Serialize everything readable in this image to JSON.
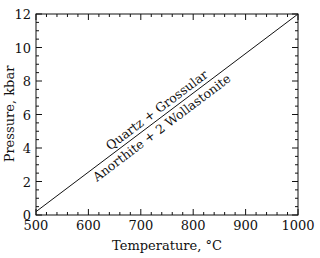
{
  "chart_data": {
    "type": "line",
    "title": "",
    "xlabel": "Temperature, °C",
    "ylabel": "Pressure, kbar",
    "xlim": [
      500,
      1000
    ],
    "ylim": [
      0,
      12
    ],
    "x_ticks": [
      500,
      600,
      700,
      800,
      900,
      1000
    ],
    "y_ticks": [
      0,
      2,
      4,
      6,
      8,
      10,
      12
    ],
    "grid": false,
    "series": [
      {
        "name": "reaction boundary",
        "x": [
          500,
          1000
        ],
        "y": [
          0.2,
          12
        ]
      }
    ],
    "annotations": [
      {
        "text": "Quartz + Grossular",
        "position": "above line"
      },
      {
        "text": "Anorthite + 2 Wollastonite",
        "position": "below line"
      }
    ]
  }
}
